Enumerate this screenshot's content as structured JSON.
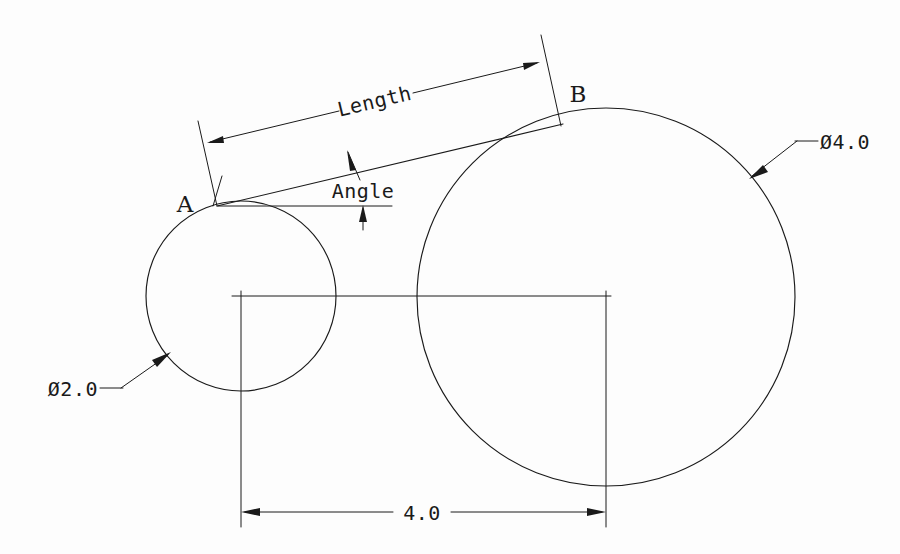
{
  "drawing": {
    "title": "Two tangent circles with tangent line dimensioning",
    "background_color": "#fdfdfd",
    "line_color": "#1a1a1a",
    "labels": {
      "point_a": "A",
      "point_b": "B",
      "length_dimension": "Length",
      "angle_dimension": "Angle",
      "small_circle_diameter": "Ø2.0",
      "large_circle_diameter": "Ø4.0",
      "center_distance": "4.0"
    },
    "geometry": {
      "small_circle": {
        "name": "small-circle",
        "center_x": 241,
        "center_y": 296,
        "radius": 95,
        "diameter_value": "2.0"
      },
      "large_circle": {
        "name": "large-circle",
        "center_x": 606,
        "center_y": 297,
        "radius": 189,
        "diameter_value": "4.0"
      },
      "tangent_line": {
        "name": "external-tangent-line",
        "x1": 217,
        "y1": 206,
        "x2": 562,
        "y2": 124
      },
      "horizontal_reference": {
        "name": "angle-reference-line",
        "x1": 218,
        "y1": 206,
        "x2": 392,
        "y2": 206
      },
      "center_distance_value": "4.0"
    }
  }
}
